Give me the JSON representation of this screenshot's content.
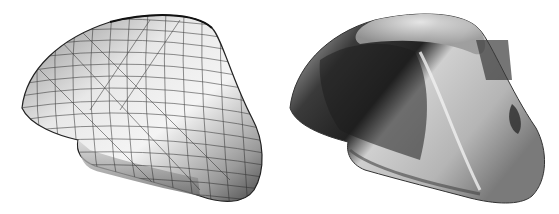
{
  "figure": {
    "panels": [
      {
        "id": "wireframe-render",
        "description": "mesh wireframe over shaded surface",
        "colors": {
          "surface_light": "#f2f2f2",
          "surface_mid": "#bdbdbd",
          "surface_dark": "#5a5a5a",
          "mesh": "#2a2a2a"
        }
      },
      {
        "id": "chrome-render",
        "description": "reflective chrome shaded surface",
        "colors": {
          "highlight": "#f5f5f5",
          "mid": "#a8a8a8",
          "dark": "#2e2e2e",
          "shadow": "#111111"
        }
      }
    ],
    "background": "#ffffff"
  }
}
